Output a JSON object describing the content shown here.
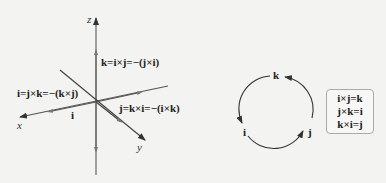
{
  "axes": {
    "x_label": "x",
    "y_label": "y",
    "z_label": "z",
    "unit_i_label": "i"
  },
  "equations": {
    "k_eq": "k=i×j=−(j×i)",
    "i_eq": "i=j×k=−(k×j)",
    "j_eq": "j=k×i=−(i×k)"
  },
  "cycle": {
    "nodes": [
      "k",
      "i",
      "j"
    ],
    "direction": "counterclockwise: k → i → j → k"
  },
  "rules": [
    "i×j=k",
    "j×k=i",
    "k×i=j"
  ],
  "colors": {
    "axis": "#555555",
    "text": "#222222",
    "background": "#f3f3f1",
    "box_border": "#aaaaaa"
  }
}
